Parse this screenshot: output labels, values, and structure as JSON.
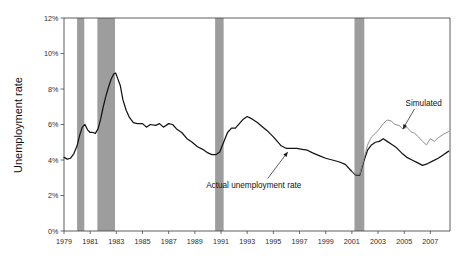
{
  "chart_data": {
    "type": "line",
    "title": "",
    "xlabel": "",
    "ylabel": "Unemployment rate",
    "xlim": [
      1979.0,
      2008.5
    ],
    "ylim": [
      0,
      12
    ],
    "y_tick_labels": [
      "0%",
      "2%",
      "4%",
      "6%",
      "8%",
      "10%",
      "12%"
    ],
    "y_tick_values": [
      0,
      2,
      4,
      6,
      8,
      10,
      12
    ],
    "x_tick_labels": [
      "1979",
      "1981",
      "1983",
      "1985",
      "1987",
      "1989",
      "1991",
      "1993",
      "1995",
      "1997",
      "1999",
      "2001",
      "2003",
      "2005",
      "2007"
    ],
    "x_tick_values": [
      1979,
      1981,
      1983,
      1985,
      1987,
      1989,
      1991,
      1993,
      1995,
      1997,
      1999,
      2001,
      2003,
      2005,
      2007
    ],
    "grid": false,
    "legend": "none",
    "annotations": [
      {
        "name": "simulated",
        "text": "Simulated",
        "x": 2005.1,
        "y": 7.05,
        "arrow_to_x": 2004.9,
        "arrow_to_y": 5.75
      },
      {
        "name": "actual",
        "text": "Actual unemployment rate",
        "x": 1993.5,
        "y": 2.45,
        "arrow_to_x": 1996.1,
        "arrow_to_y": 4.45
      }
    ],
    "recession_bands": [
      {
        "start": 1980.0,
        "end": 1980.55
      },
      {
        "start": 1981.55,
        "end": 1982.9
      },
      {
        "start": 1990.55,
        "end": 1991.2
      },
      {
        "start": 2001.2,
        "end": 2001.95
      }
    ],
    "band_color": "#9d9d9d",
    "series": [
      {
        "name": "Actual unemployment rate",
        "color": "#141414",
        "x": [
          1979.0,
          1979.25,
          1979.5,
          1979.75,
          1980.0,
          1980.2,
          1980.4,
          1980.6,
          1980.8,
          1981.0,
          1981.2,
          1981.4,
          1981.6,
          1981.8,
          1982.0,
          1982.2,
          1982.4,
          1982.6,
          1982.8,
          1982.95,
          1983.1,
          1983.3,
          1983.5,
          1983.75,
          1984.0,
          1984.3,
          1984.6,
          1985.0,
          1985.3,
          1985.6,
          1986.0,
          1986.3,
          1986.6,
          1987.0,
          1987.3,
          1987.6,
          1988.0,
          1988.4,
          1988.8,
          1989.2,
          1989.6,
          1990.0,
          1990.3,
          1990.6,
          1990.9,
          1991.2,
          1991.5,
          1991.8,
          1992.1,
          1992.4,
          1992.7,
          1993.0,
          1993.4,
          1993.8,
          1994.2,
          1994.6,
          1995.0,
          1995.3,
          1995.6,
          1996.0,
          1996.4,
          1996.8,
          1997.2,
          1997.6,
          1998.0,
          1998.5,
          1999.0,
          1999.5,
          2000.0,
          2000.5,
          2001.0,
          2001.3,
          2001.6,
          2001.9,
          2002.2,
          2002.5,
          2002.8,
          2003.1,
          2003.4,
          2003.7,
          2004.0,
          2004.4,
          2004.8,
          2005.2,
          2005.6,
          2006.0,
          2006.4,
          2006.8,
          2007.2,
          2007.6,
          2008.0,
          2008.4
        ],
        "y": [
          4.15,
          4.05,
          4.1,
          4.35,
          4.8,
          5.4,
          5.85,
          6.0,
          5.7,
          5.55,
          5.55,
          5.5,
          5.75,
          6.3,
          7.0,
          7.6,
          8.1,
          8.55,
          8.85,
          8.9,
          8.6,
          8.2,
          7.4,
          6.8,
          6.4,
          6.1,
          6.05,
          6.05,
          5.85,
          6.0,
          5.95,
          6.05,
          5.85,
          6.05,
          6.0,
          5.75,
          5.55,
          5.2,
          5.0,
          4.75,
          4.6,
          4.4,
          4.3,
          4.3,
          4.45,
          5.0,
          5.55,
          5.8,
          5.8,
          6.05,
          6.3,
          6.45,
          6.3,
          6.1,
          5.85,
          5.6,
          5.3,
          5.05,
          4.8,
          4.65,
          4.65,
          4.65,
          4.6,
          4.55,
          4.4,
          4.25,
          4.1,
          4.0,
          3.9,
          3.75,
          3.35,
          3.15,
          3.15,
          3.9,
          4.55,
          4.85,
          5.0,
          5.05,
          5.2,
          5.05,
          4.9,
          4.7,
          4.4,
          4.15,
          4.0,
          3.85,
          3.7,
          3.8,
          3.95,
          4.1,
          4.3,
          4.5
        ]
      },
      {
        "name": "Simulated",
        "color": "#8f8f8f",
        "x": [
          2001.0,
          2001.3,
          2001.6,
          2001.9,
          2002.2,
          2002.5,
          2002.8,
          2003.1,
          2003.4,
          2003.7,
          2004.0,
          2004.3,
          2004.6,
          2004.9,
          2005.2,
          2005.5,
          2005.8,
          2006.1,
          2006.4,
          2006.7,
          2007.0,
          2007.3,
          2007.6,
          2008.0,
          2008.4
        ],
        "y": [
          3.35,
          3.2,
          3.2,
          4.0,
          4.85,
          5.3,
          5.5,
          5.75,
          6.05,
          6.25,
          6.2,
          6.0,
          5.95,
          5.75,
          5.85,
          5.6,
          5.5,
          5.3,
          5.05,
          4.85,
          5.2,
          5.05,
          5.25,
          5.45,
          5.6
        ]
      }
    ]
  }
}
